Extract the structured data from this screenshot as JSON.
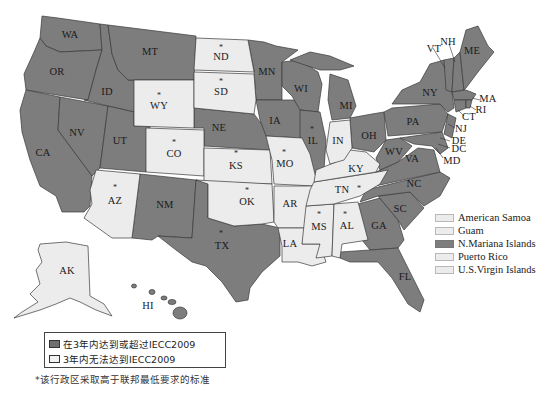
{
  "colors": {
    "compliant": "#7d7d7d",
    "noncompliant": "#ececec",
    "border": "#3a3a3a",
    "background": "#ffffff"
  },
  "states": {
    "WA": {
      "label": "WA",
      "status": "compliant",
      "star": false
    },
    "OR": {
      "label": "OR",
      "status": "compliant",
      "star": false
    },
    "CA": {
      "label": "CA",
      "status": "compliant",
      "star": false
    },
    "NV": {
      "label": "NV",
      "status": "compliant",
      "star": false
    },
    "ID": {
      "label": "ID",
      "status": "compliant",
      "star": false
    },
    "MT": {
      "label": "MT",
      "status": "compliant",
      "star": false
    },
    "WY": {
      "label": "WY",
      "status": "noncompliant",
      "star": true
    },
    "UT": {
      "label": "UT",
      "status": "compliant",
      "star": false
    },
    "CO": {
      "label": "CO",
      "status": "noncompliant",
      "star": true
    },
    "AZ": {
      "label": "AZ",
      "status": "noncompliant",
      "star": true
    },
    "NM": {
      "label": "NM",
      "status": "compliant",
      "star": false
    },
    "ND": {
      "label": "ND",
      "status": "noncompliant",
      "star": true
    },
    "SD": {
      "label": "SD",
      "status": "noncompliant",
      "star": true
    },
    "NE": {
      "label": "NE",
      "status": "compliant",
      "star": false
    },
    "KS": {
      "label": "KS",
      "status": "noncompliant",
      "star": true
    },
    "OK": {
      "label": "OK",
      "status": "noncompliant",
      "star": true
    },
    "TX": {
      "label": "TX",
      "status": "compliant",
      "star": true
    },
    "MN": {
      "label": "MN",
      "status": "compliant",
      "star": false
    },
    "IA": {
      "label": "IA",
      "status": "compliant",
      "star": false
    },
    "MO": {
      "label": "MO",
      "status": "noncompliant",
      "star": true
    },
    "AR": {
      "label": "AR",
      "status": "noncompliant",
      "star": false
    },
    "LA": {
      "label": "LA",
      "status": "noncompliant",
      "star": false
    },
    "WI": {
      "label": "WI",
      "status": "compliant",
      "star": false
    },
    "IL": {
      "label": "IL",
      "status": "compliant",
      "star": true
    },
    "MI": {
      "label": "MI",
      "status": "compliant",
      "star": false
    },
    "IN": {
      "label": "IN",
      "status": "noncompliant",
      "star": false
    },
    "OH": {
      "label": "OH",
      "status": "compliant",
      "star": false
    },
    "KY": {
      "label": "KY",
      "status": "noncompliant",
      "star": false
    },
    "TN": {
      "label": "TN",
      "status": "noncompliant",
      "star": true
    },
    "MS": {
      "label": "MS",
      "status": "noncompliant",
      "star": true
    },
    "AL": {
      "label": "AL",
      "status": "noncompliant",
      "star": true
    },
    "GA": {
      "label": "GA",
      "status": "compliant",
      "star": false
    },
    "FL": {
      "label": "FL",
      "status": "compliant",
      "star": false
    },
    "SC": {
      "label": "SC",
      "status": "compliant",
      "star": false
    },
    "NC": {
      "label": "NC",
      "status": "compliant",
      "star": false
    },
    "VA": {
      "label": "VA",
      "status": "compliant",
      "star": false
    },
    "WV": {
      "label": "WV",
      "status": "compliant",
      "star": false
    },
    "PA": {
      "label": "PA",
      "status": "compliant",
      "star": false
    },
    "NY": {
      "label": "NY",
      "status": "compliant",
      "star": false
    },
    "VT": {
      "label": "VT",
      "status": "compliant",
      "star": false
    },
    "NH": {
      "label": "NH",
      "status": "compliant",
      "star": false
    },
    "ME": {
      "label": "ME",
      "status": "compliant",
      "star": false
    },
    "MA": {
      "label": "MA",
      "status": "compliant",
      "star": false
    },
    "RI": {
      "label": "RI",
      "status": "compliant",
      "star": false
    },
    "CT": {
      "label": "CT",
      "status": "compliant",
      "star": false
    },
    "NJ": {
      "label": "NJ",
      "status": "compliant",
      "star": false
    },
    "DE": {
      "label": "DE",
      "status": "compliant",
      "star": false
    },
    "DC": {
      "label": "DC",
      "status": "compliant",
      "star": false
    },
    "MD": {
      "label": "MD",
      "status": "compliant",
      "star": false
    },
    "AK": {
      "label": "AK",
      "status": "noncompliant",
      "star": false
    },
    "HI": {
      "label": "HI",
      "status": "compliant",
      "star": false
    }
  },
  "territories_legend": [
    {
      "label": "American Samoa",
      "status": "noncompliant"
    },
    {
      "label": "Guam",
      "status": "noncompliant"
    },
    {
      "label": "N.Mariana Islands",
      "status": "compliant"
    },
    {
      "label": "Puerto Rico",
      "status": "noncompliant"
    },
    {
      "label": "U.S.Virgin Islands",
      "status": "noncompliant"
    }
  ],
  "legend": {
    "compliant_label": "在3年内达到或超过IECC2009",
    "noncompliant_label": "3年内无法达到IECC2009"
  },
  "note": "*该行政区采取高于联邦最低要求的标准",
  "star_glyph": "*"
}
